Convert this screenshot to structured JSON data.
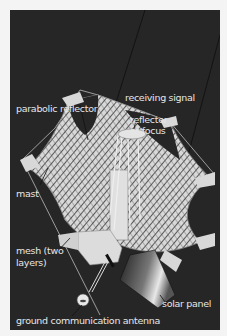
{
  "diagram": {
    "background_color": "#262626",
    "label_color": "#e6e6e6",
    "labels": {
      "parabolic_reflector": "parabolic reflector",
      "receiving_signal": "receiving signal",
      "reflector_at_focus_line1": "reflector",
      "reflector_at_focus_line2": "at focus",
      "mast": "mast",
      "mesh_line1": "mesh (two",
      "mesh_line2": "layers)",
      "solar_panel": "solar panel",
      "ground_antenna": "ground communication antenna"
    }
  }
}
